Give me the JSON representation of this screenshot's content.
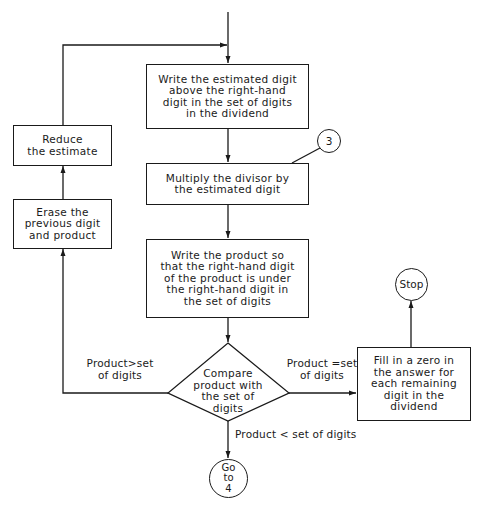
{
  "diagram": {
    "type": "flowchart",
    "nodes": {
      "write_estimated": {
        "text": "Write the estimated digit\nabove the right-hand\ndigit in the set of digits\nin the dividend"
      },
      "multiply": {
        "text": "Multiply the divisor by\nthe estimated digit"
      },
      "connector_3": {
        "text": "3"
      },
      "write_product": {
        "text": "Write the product so\nthat the right-hand digit\nof the product is under\nthe right-hand digit in\nthe set of digits"
      },
      "compare": {
        "text": "Compare\nproduct with\nthe set of\ndigits"
      },
      "reduce": {
        "text": "Reduce\nthe estimate"
      },
      "erase": {
        "text": "Erase the\nprevious digit\nand product"
      },
      "fill_zero": {
        "text": "Fill in a zero in\nthe answer for\neach remaining\ndigit in the\ndividend"
      },
      "stop": {
        "text": "Stop"
      },
      "goto_4": {
        "text": "Go\nto\n4"
      }
    },
    "edge_labels": {
      "greater": "Product>set\nof digits",
      "equal": "Product =set\nof digits",
      "less": "Product < set of digits"
    },
    "colors": {
      "ink": "#1a1a1a",
      "background": "#ffffff"
    }
  }
}
